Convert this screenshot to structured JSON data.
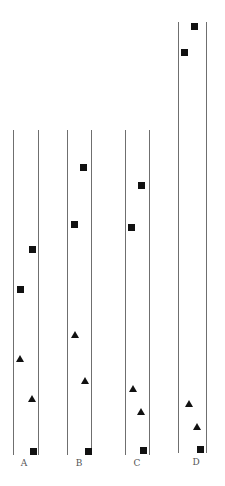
{
  "diagram": {
    "colors": {
      "line": "#6f6f6f",
      "marker": "#111111",
      "label": "#555555",
      "background": "#ffffff"
    },
    "lanes": [
      {
        "label": "A",
        "left_x": 13,
        "right_x": 38,
        "top_y": 130,
        "bottom_y": 455,
        "label_pos": [
          24,
          459
        ],
        "markers": [
          {
            "shape": "square",
            "x": 32,
            "y": 249
          },
          {
            "shape": "square",
            "x": 20,
            "y": 289
          },
          {
            "shape": "triangle",
            "x": 20,
            "y": 359
          },
          {
            "shape": "triangle",
            "x": 32,
            "y": 399
          },
          {
            "shape": "square",
            "x": 33,
            "y": 451
          }
        ]
      },
      {
        "label": "B",
        "left_x": 67,
        "right_x": 91,
        "top_y": 130,
        "bottom_y": 455,
        "label_pos": [
          79,
          459
        ],
        "markers": [
          {
            "shape": "square",
            "x": 83,
            "y": 167
          },
          {
            "shape": "square",
            "x": 74,
            "y": 224
          },
          {
            "shape": "triangle",
            "x": 75,
            "y": 335
          },
          {
            "shape": "triangle",
            "x": 85,
            "y": 381
          },
          {
            "shape": "square",
            "x": 88,
            "y": 451
          }
        ]
      },
      {
        "label": "C",
        "left_x": 125,
        "right_x": 149,
        "top_y": 130,
        "bottom_y": 455,
        "label_pos": [
          137,
          459
        ],
        "markers": [
          {
            "shape": "square",
            "x": 141,
            "y": 185
          },
          {
            "shape": "square",
            "x": 131,
            "y": 227
          },
          {
            "shape": "triangle",
            "x": 133,
            "y": 389
          },
          {
            "shape": "triangle",
            "x": 141,
            "y": 412
          },
          {
            "shape": "square",
            "x": 143,
            "y": 450
          }
        ]
      },
      {
        "label": "D",
        "left_x": 178,
        "right_x": 206,
        "top_y": 22,
        "bottom_y": 453,
        "label_pos": [
          196,
          458
        ],
        "markers": [
          {
            "shape": "square",
            "x": 194,
            "y": 26
          },
          {
            "shape": "square",
            "x": 184,
            "y": 52
          },
          {
            "shape": "triangle",
            "x": 189,
            "y": 404
          },
          {
            "shape": "triangle",
            "x": 197,
            "y": 427
          },
          {
            "shape": "square",
            "x": 200,
            "y": 449
          }
        ]
      }
    ]
  }
}
